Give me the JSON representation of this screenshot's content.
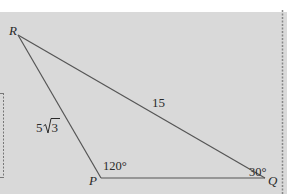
{
  "figure": {
    "type": "triangle",
    "background_color": "#d9d9d9",
    "line_color": "#555555",
    "vertices": [
      {
        "name": "R",
        "label": "R",
        "x": 18,
        "y": 35
      },
      {
        "name": "P",
        "label": "P",
        "x": 101,
        "y": 178
      },
      {
        "name": "Q",
        "label": "Q",
        "x": 265,
        "y": 178
      }
    ],
    "sides": [
      {
        "from": "R",
        "to": "P",
        "label": "5√3",
        "coefficient": "5",
        "radicand": "3"
      },
      {
        "from": "R",
        "to": "Q",
        "label": "15"
      },
      {
        "from": "P",
        "to": "Q",
        "label": ""
      }
    ],
    "angles": [
      {
        "vertex": "P",
        "label": "120°"
      },
      {
        "vertex": "Q",
        "label": "30°"
      }
    ]
  },
  "labels": {
    "R": "R",
    "P": "P",
    "Q": "Q",
    "side_RP_coef": "5",
    "side_RP_radicand": "3",
    "side_RQ": "15",
    "angle_P": "120°",
    "angle_Q": "30°"
  }
}
